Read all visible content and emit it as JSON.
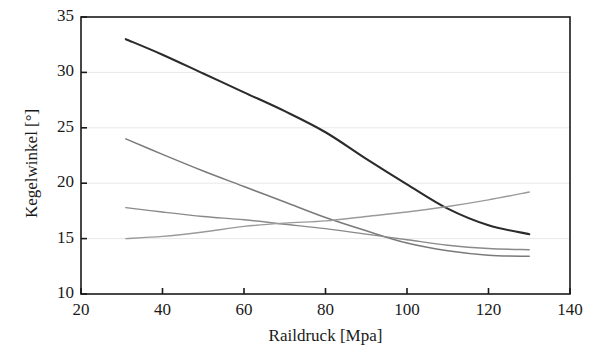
{
  "chart_data": {
    "type": "line",
    "title": "",
    "xlabel": "Raildruck [Mpa]",
    "ylabel": "Kegelwinkel [°]",
    "xlim": [
      20,
      140
    ],
    "ylim": [
      10,
      35
    ],
    "xticks": [
      20,
      40,
      60,
      80,
      100,
      120,
      140
    ],
    "yticks": [
      10,
      15,
      20,
      25,
      30,
      35
    ],
    "xtick_labels": [
      "20",
      "40",
      "60",
      "80",
      "100",
      "120",
      "140"
    ],
    "ytick_labels": [
      "10",
      "15",
      "20",
      "25",
      "30",
      "35"
    ],
    "grid": "horizontal-faint",
    "legend": "none",
    "background": "#ffffff",
    "frame_color": "#1a1a1a",
    "gridline_color": "#e8e8e8",
    "series": [
      {
        "name": "curve-1",
        "color": "#2b2b2b",
        "width": 2.1,
        "x": [
          31,
          40,
          50,
          60,
          70,
          80,
          90,
          100,
          110,
          120,
          130
        ],
        "y": [
          33.0,
          31.6,
          29.9,
          28.2,
          26.5,
          24.6,
          22.2,
          19.9,
          17.7,
          16.2,
          15.4
        ]
      },
      {
        "name": "curve-2",
        "color": "#7a7a7a",
        "width": 1.5,
        "x": [
          31,
          40,
          50,
          60,
          70,
          80,
          90,
          100,
          110,
          120,
          130
        ],
        "y": [
          24.0,
          22.6,
          21.1,
          19.7,
          18.3,
          16.9,
          15.7,
          14.6,
          13.9,
          13.5,
          13.4
        ]
      },
      {
        "name": "curve-3",
        "color": "#8a8a8a",
        "width": 1.4,
        "x": [
          31,
          40,
          50,
          60,
          70,
          80,
          90,
          100,
          110,
          120,
          130
        ],
        "y": [
          17.8,
          17.4,
          17.0,
          16.7,
          16.3,
          15.9,
          15.4,
          14.9,
          14.4,
          14.1,
          14.0
        ]
      },
      {
        "name": "curve-4",
        "color": "#9a9a9a",
        "width": 1.4,
        "x": [
          31,
          40,
          50,
          60,
          70,
          80,
          90,
          100,
          110,
          120,
          130
        ],
        "y": [
          15.0,
          15.2,
          15.6,
          16.1,
          16.4,
          16.6,
          17.0,
          17.4,
          17.9,
          18.5,
          19.2
        ]
      }
    ]
  }
}
